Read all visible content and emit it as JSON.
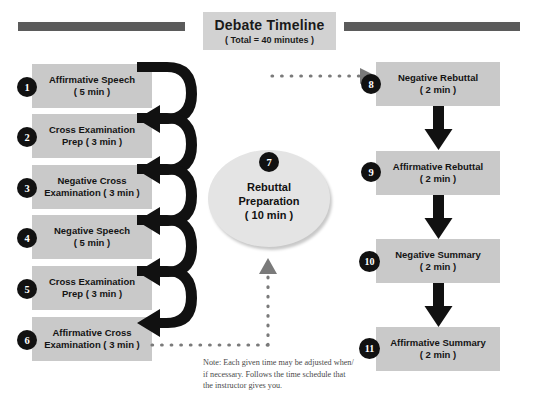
{
  "title": {
    "main": "Debate Timeline",
    "sub": "( Total = 40 minutes )"
  },
  "left_column": [
    {
      "num": "1",
      "line1": "Affirmative Speech",
      "line2": "( 5 min )"
    },
    {
      "num": "2",
      "line1": "Cross Examination",
      "line2": "Prep ( 3 min )"
    },
    {
      "num": "3",
      "line1": "Negative Cross",
      "line2": "Examination ( 3 min )"
    },
    {
      "num": "4",
      "line1": "Negative Speech",
      "line2": "( 5 min )"
    },
    {
      "num": "5",
      "line1": "Cross Examination",
      "line2": "Prep ( 3 min )"
    },
    {
      "num": "6",
      "line1": "Affirmative Cross",
      "line2": "Examination ( 3 min )"
    }
  ],
  "center": {
    "num": "7",
    "line1": "Rebuttal",
    "line2": "Preparation",
    "line3": "( 10 min )"
  },
  "right_column": [
    {
      "num": "8",
      "line1": "Negative Rebuttal",
      "line2": "( 2 min )"
    },
    {
      "num": "9",
      "line1": "Affirmative Rebuttal",
      "line2": "( 2 min )"
    },
    {
      "num": "10",
      "line1": "Negative Summary",
      "line2": "( 2 min )"
    },
    {
      "num": "11",
      "line1": "Affirmative Summary",
      "line2": "( 2 min )"
    }
  ],
  "note": {
    "line1": "Note: Each given time may be adjusted when/",
    "line2": "if necessary. Follows the time schedule that",
    "line3": "the instructor gives you."
  },
  "colors": {
    "bar": "#5b5b5b",
    "box_fill": "#c9c9c9",
    "title_fill": "#d2d2d2",
    "oval_fill": "#e4e4e4",
    "arrow_dark": "#111111",
    "dotted": "#7a7a7a"
  }
}
